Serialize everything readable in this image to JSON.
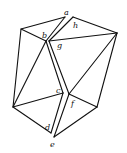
{
  "diagram": {
    "title": "",
    "labels": [
      {
        "id": "a",
        "text": "a",
        "x": 64,
        "y": 15
      },
      {
        "id": "b",
        "text": "b",
        "x": 43,
        "y": 37
      },
      {
        "id": "g",
        "text": "g",
        "x": 57,
        "y": 48
      },
      {
        "id": "h",
        "text": "h",
        "x": 73,
        "y": 27
      },
      {
        "id": "c",
        "text": "c",
        "x": 56,
        "y": 93
      },
      {
        "id": "f",
        "text": "f",
        "x": 70,
        "y": 106
      },
      {
        "id": "d",
        "text": "d",
        "x": 45,
        "y": 130
      },
      {
        "id": "e",
        "text": "e",
        "x": 50,
        "y": 147
      }
    ],
    "left_piece": {
      "vertices": {
        "top_left": [
          21,
          29
        ],
        "a": [
          65,
          17
        ],
        "b": [
          46,
          41
        ],
        "c": [
          63,
          93
        ],
        "left_bottom": [
          13,
          107
        ],
        "d": [
          51,
          133
        ],
        "e": [
          53,
          137
        ]
      }
    },
    "right_piece": {
      "vertices": {
        "top": [
          73,
          17
        ],
        "right": [
          117,
          33
        ],
        "g": [
          53,
          43
        ],
        "f": [
          68,
          94
        ],
        "bottom_right": [
          97,
          107
        ],
        "e_tip": [
          55,
          137
        ]
      }
    },
    "stroke_color": "#111111",
    "background": "#ffffff"
  }
}
